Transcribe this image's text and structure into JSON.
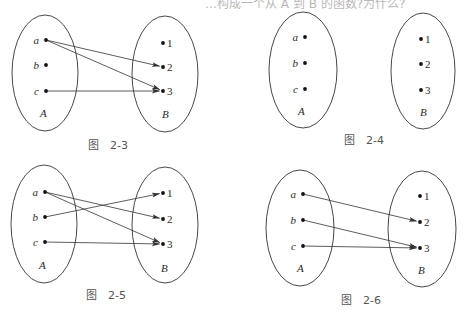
{
  "top_fragment": "…构成一个从 A 到 B 的函数?为什么?",
  "figures": [
    {
      "caption": "图　2-3",
      "caption_pos": [
        88,
        149
      ],
      "ellipse_a": {
        "cx": 45,
        "cy": 73,
        "rx": 33,
        "ry": 58
      },
      "ellipse_b": {
        "cx": 165,
        "cy": 74,
        "rx": 33,
        "ry": 58
      },
      "set_a_label": "A",
      "set_a_label_pos": [
        40,
        117
      ],
      "set_b_label": "B",
      "set_b_label_pos": [
        162,
        118
      ],
      "domain": [
        {
          "label": "a",
          "x": 46,
          "y": 40
        },
        {
          "label": "b",
          "x": 46,
          "y": 65
        },
        {
          "label": "c",
          "x": 46,
          "y": 91
        }
      ],
      "codomain": [
        {
          "label": "1",
          "x": 163,
          "y": 43
        },
        {
          "label": "2",
          "x": 163,
          "y": 67
        },
        {
          "label": "3",
          "x": 163,
          "y": 91
        }
      ],
      "mappings": [
        [
          0,
          1
        ],
        [
          0,
          2
        ],
        [
          2,
          2
        ]
      ]
    },
    {
      "caption": "图　2-4",
      "caption_pos": [
        344,
        144
      ],
      "ellipse_a": {
        "cx": 303,
        "cy": 70,
        "rx": 34,
        "ry": 58
      },
      "ellipse_b": {
        "cx": 423,
        "cy": 71,
        "rx": 32,
        "ry": 58
      },
      "set_a_label": "A",
      "set_a_label_pos": [
        298,
        115
      ],
      "set_b_label": "B",
      "set_b_label_pos": [
        420,
        116
      ],
      "domain": [
        {
          "label": "a",
          "x": 305,
          "y": 37
        },
        {
          "label": "b",
          "x": 305,
          "y": 63
        },
        {
          "label": "c",
          "x": 305,
          "y": 89
        }
      ],
      "codomain": [
        {
          "label": "1",
          "x": 421,
          "y": 39
        },
        {
          "label": "2",
          "x": 421,
          "y": 64
        },
        {
          "label": "3",
          "x": 421,
          "y": 90
        }
      ],
      "mappings": []
    },
    {
      "caption": "图　2-5",
      "caption_pos": [
        86,
        299
      ],
      "ellipse_a": {
        "cx": 44,
        "cy": 224,
        "rx": 33,
        "ry": 59
      },
      "ellipse_b": {
        "cx": 165,
        "cy": 225,
        "rx": 33,
        "ry": 58
      },
      "set_a_label": "A",
      "set_a_label_pos": [
        39,
        269
      ],
      "set_b_label": "B",
      "set_b_label_pos": [
        161,
        272
      ],
      "domain": [
        {
          "label": "a",
          "x": 45,
          "y": 192
        },
        {
          "label": "b",
          "x": 45,
          "y": 217
        },
        {
          "label": "c",
          "x": 45,
          "y": 242
        }
      ],
      "codomain": [
        {
          "label": "1",
          "x": 163,
          "y": 193
        },
        {
          "label": "2",
          "x": 163,
          "y": 219
        },
        {
          "label": "3",
          "x": 163,
          "y": 244
        }
      ],
      "mappings": [
        [
          0,
          1
        ],
        [
          0,
          2
        ],
        [
          1,
          0
        ],
        [
          2,
          2
        ]
      ]
    },
    {
      "caption": "图　2-6",
      "caption_pos": [
        341,
        304
      ],
      "ellipse_a": {
        "cx": 300,
        "cy": 228,
        "rx": 34,
        "ry": 58
      },
      "ellipse_b": {
        "cx": 422,
        "cy": 229,
        "rx": 34,
        "ry": 58
      },
      "set_a_label": "A",
      "set_a_label_pos": [
        297,
        272
      ],
      "set_b_label": "B",
      "set_b_label_pos": [
        418,
        274
      ],
      "domain": [
        {
          "label": "a",
          "x": 303,
          "y": 194
        },
        {
          "label": "b",
          "x": 303,
          "y": 220
        },
        {
          "label": "c",
          "x": 303,
          "y": 246
        }
      ],
      "codomain": [
        {
          "label": "1",
          "x": 420,
          "y": 196
        },
        {
          "label": "2",
          "x": 420,
          "y": 222
        },
        {
          "label": "3",
          "x": 420,
          "y": 248
        }
      ],
      "mappings": [
        [
          0,
          1
        ],
        [
          1,
          2
        ],
        [
          2,
          2
        ]
      ]
    }
  ],
  "colors": {
    "stroke": "#333333",
    "text": "#2a2a2a",
    "caption": "#555555"
  }
}
